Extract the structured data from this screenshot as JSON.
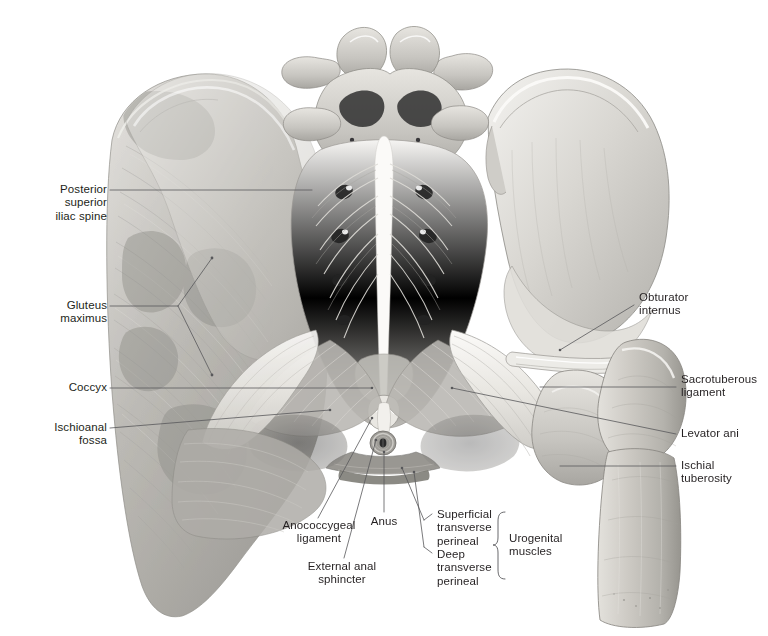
{
  "figure": {
    "background_color": "#ffffff",
    "label_color": "#231f20",
    "leader_color": "#58585b"
  },
  "labels": {
    "posterior_superior_iliac_spine": "Posterior\nsuperior\niliac spine",
    "gluteus_maximus": "Gluteus\nmaximus",
    "coccyx": "Coccyx",
    "ischioanal_fossa": "Ischioanal\nfossa",
    "obturator_internus": "Obturator\ninternus",
    "sacrotuberous_ligament": "Sacrotuberous\nligament",
    "levator_ani": "Levator ani",
    "ischial_tuberosity": "Ischial\ntuberosity",
    "anococcygeal_ligament": "Anococcygeal\nligament",
    "external_anal_sphincter": "External anal\nsphincter",
    "anus": "Anus",
    "superficial_transverse_perineal": "Superficial\ntransverse\nperineal",
    "deep_transverse_perineal": "Deep\ntransverse\nperineal",
    "urogenital_muscles": "Urogenital\nmuscles"
  },
  "label_list": [
    {
      "id": "posterior-superior-iliac-spine",
      "text": "Posterior superior iliac spine",
      "side": "left"
    },
    {
      "id": "gluteus-maximus",
      "text": "Gluteus maximus",
      "side": "left"
    },
    {
      "id": "coccyx",
      "text": "Coccyx",
      "side": "left"
    },
    {
      "id": "ischioanal-fossa",
      "text": "Ischioanal fossa",
      "side": "left"
    },
    {
      "id": "obturator-internus",
      "text": "Obturator internus",
      "side": "right"
    },
    {
      "id": "sacrotuberous-ligament",
      "text": "Sacrotuberous ligament",
      "side": "right"
    },
    {
      "id": "levator-ani",
      "text": "Levator ani",
      "side": "right"
    },
    {
      "id": "ischial-tuberosity",
      "text": "Ischial tuberosity",
      "side": "right"
    },
    {
      "id": "anococcygeal-ligament",
      "text": "Anococcygeal ligament",
      "side": "bottom"
    },
    {
      "id": "external-anal-sphincter",
      "text": "External anal sphincter",
      "side": "bottom"
    },
    {
      "id": "anus",
      "text": "Anus",
      "side": "bottom"
    },
    {
      "id": "superficial-transverse-perineal",
      "text": "Superficial transverse perineal",
      "side": "bottom"
    },
    {
      "id": "deep-transverse-perineal",
      "text": "Deep transverse perineal",
      "side": "bottom"
    },
    {
      "id": "urogenital-muscles",
      "text": "Urogenital muscles",
      "side": "bottom"
    }
  ]
}
